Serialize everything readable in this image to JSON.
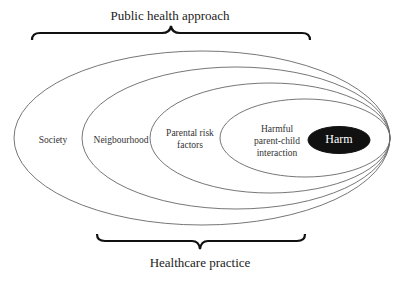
{
  "diagram": {
    "top_bracket_label": "Public health approach",
    "bottom_bracket_label": "Healthcare practice",
    "levels": [
      {
        "label": "Society"
      },
      {
        "label": "Neigbourhood"
      },
      {
        "label": "Parental risk factors"
      },
      {
        "label": "Harmful parent-child interaction"
      },
      {
        "label": "Harm",
        "filled": true
      }
    ],
    "colors": {
      "line": "#555555",
      "harm_fill": "#111111",
      "text": "#333333"
    }
  }
}
